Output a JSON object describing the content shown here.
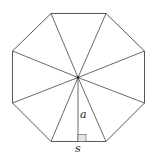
{
  "diagram": {
    "shape": "regular-octagon",
    "stroke_color": "#444444",
    "box_fill": "#e6e6e6",
    "labels": {
      "apothem": "a",
      "side": "s"
    }
  }
}
